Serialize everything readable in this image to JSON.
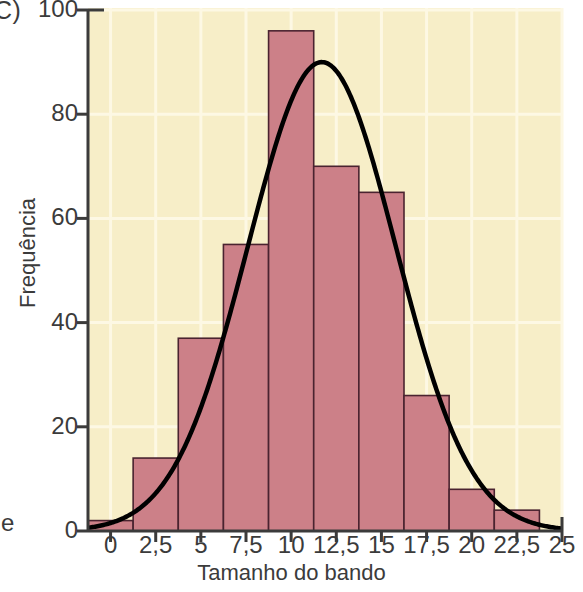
{
  "figure": {
    "panel_letter": "C)",
    "stray_left_text": "e"
  },
  "chart_data": {
    "type": "bar",
    "title": "",
    "xlabel": "Tamanho do bando",
    "ylabel": "Frequência",
    "xlim": [
      -1.25,
      25
    ],
    "ylim": [
      0,
      100
    ],
    "grid": true,
    "legend": null,
    "bin_width": 2.5,
    "categories": [
      "0",
      "2,5",
      "5",
      "7,5",
      "10",
      "12,5",
      "15",
      "17,5",
      "20",
      "22,5"
    ],
    "bin_centers": [
      0,
      2.5,
      5,
      7.5,
      10,
      12.5,
      15,
      17.5,
      20,
      22.5
    ],
    "values": [
      2,
      14,
      37,
      55,
      96,
      70,
      65,
      26,
      8,
      4
    ],
    "xticks": [
      0,
      2.5,
      5,
      7.5,
      10,
      12.5,
      15,
      17.5,
      20,
      22.5,
      25
    ],
    "xtick_labels": [
      "0",
      "2,5",
      "5",
      "7,5",
      "10",
      "12,5",
      "15",
      "17,5",
      "20",
      "22,5",
      "25"
    ],
    "yticks": [
      0,
      20,
      40,
      60,
      80,
      100
    ],
    "ytick_labels": [
      "0",
      "20",
      "40",
      "60",
      "80",
      "100"
    ],
    "overlay_curve": {
      "type": "normal",
      "peak_value": 90,
      "mean": 11.7,
      "sigma": 4.1,
      "color": "#000000"
    },
    "colors": {
      "bar_fill": "#cc8088",
      "bar_stroke": "#4a2330",
      "plot_background": "#f7eec8",
      "grid": "#fdf8e4",
      "axis": "#3b3b3b",
      "curve": "#000000",
      "text": "#3b3b3b"
    }
  }
}
